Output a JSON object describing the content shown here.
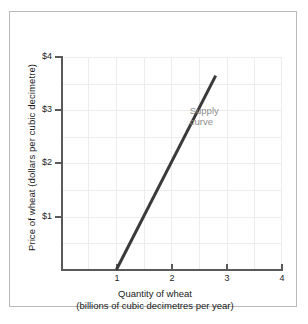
{
  "chart_data": {
    "type": "line",
    "title": "",
    "xlabel": "Quantity of wheat (billions of cubic decimetres per year)",
    "xlabel_line1": "Quantity of wheat",
    "xlabel_line2": "(billions of cubic decimetres per year)",
    "ylabel": "Price of wheat (dollars per cubic decimetre)",
    "xlim": [
      0,
      4
    ],
    "ylim": [
      0,
      4
    ],
    "x_ticks": [
      1,
      2,
      3,
      4
    ],
    "x_tick_labels": [
      "1",
      "2",
      "3",
      "4"
    ],
    "y_ticks": [
      1,
      2,
      3,
      4
    ],
    "y_tick_labels": [
      "$1",
      "$2",
      "$3",
      "$4"
    ],
    "grid": true,
    "grid_step_x": 0.5,
    "grid_step_y": 0.5,
    "grid_color": "#ececec",
    "axis_color": "#5a5a5a",
    "legend": "none",
    "series": [
      {
        "name": "Supply curve",
        "color": "#3a3a3a",
        "line_width": 3,
        "x": [
          1.0,
          2.8
        ],
        "y": [
          0.0,
          3.65
        ],
        "points": [
          {
            "x": 1.0,
            "y": 0.0
          },
          {
            "x": 2.8,
            "y": 3.65
          }
        ]
      }
    ],
    "annotations": [
      {
        "name": "supply-curve-label",
        "text": "Supply curve",
        "line1": "Supply",
        "line2": "curve",
        "x": 2.33,
        "y": 3.1,
        "color": "#8d8d8d"
      }
    ]
  },
  "figure": {
    "border_color": "#b9b9b9",
    "background": "#ffffff"
  }
}
